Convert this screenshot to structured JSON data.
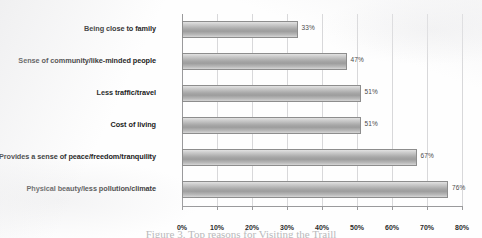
{
  "chart_data": {
    "type": "bar",
    "orientation": "horizontal",
    "title": "",
    "xlabel": "",
    "ylabel": "",
    "xlim": [
      0,
      80
    ],
    "grid": true,
    "legend": false,
    "categories": [
      "Being close to family",
      "Sense of community/like-minded people",
      "Less traffic/travel",
      "Cost of living",
      "Provides a sense of peace/freedom/tranquility",
      "Physical beauty/less pollution/climate"
    ],
    "values": [
      33,
      47,
      51,
      51,
      67,
      76
    ],
    "value_labels": [
      "33%",
      "47%",
      "51%",
      "51%",
      "67%",
      "76%"
    ],
    "xticks": [
      0,
      10,
      20,
      30,
      40,
      50,
      60,
      70,
      80
    ],
    "xtick_labels": [
      "0%",
      "10%",
      "20%",
      "30%",
      "40%",
      "50%",
      "60%",
      "70%",
      "80%"
    ],
    "bar_color": "#a8a8a8",
    "bar_border_color": "#8d8d8d",
    "gridline_color": "#d8d8da",
    "axis_color": "#9a9a9c"
  },
  "caption": {
    "text": "Figure 3. Top reasons for Visiting the Traill"
  }
}
